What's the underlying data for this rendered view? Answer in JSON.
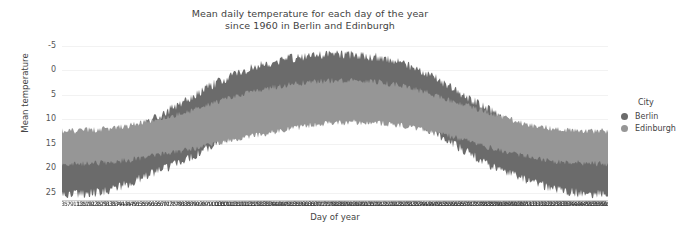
{
  "title": {
    "line1": "Mean daily temperature for each day of the year",
    "line2": "since 1960 in Berlin and Edinburgh"
  },
  "legend": {
    "title": "City",
    "items": [
      {
        "label": "Berlin",
        "color": "#6b6b6b"
      },
      {
        "label": "Edinburgh",
        "color": "#969696"
      }
    ]
  },
  "axes": {
    "ylabel": "Mean temperature",
    "xlabel": "Day of year",
    "yticks": [
      "25",
      "20",
      "15",
      "10",
      "5",
      "0",
      "-5"
    ]
  },
  "chart_data": {
    "type": "area",
    "title": "Mean daily temperature for each day of the year since 1960 in Berlin and Edinburgh",
    "xlabel": "Day of year",
    "ylabel": "Mean temperature",
    "xlim": [
      1,
      366
    ],
    "ylim": [
      -6.5,
      26
    ],
    "yticks": [
      -5,
      0,
      5,
      10,
      15,
      20,
      25
    ],
    "grid": true,
    "legend_position": "right",
    "legend_title": "City",
    "note": "Daily min-max envelope bands of mean temperature across years since 1960; x tick labels are day-of-year values drawn so densely that they overlap into an unreadable dark smear along the bottom axis.",
    "series": [
      {
        "name": "Berlin",
        "color": "#6b6b6b",
        "kind": "envelope",
        "x": [
          1,
          15,
          32,
          46,
          60,
          74,
          91,
          105,
          121,
          135,
          152,
          166,
          182,
          196,
          213,
          227,
          244,
          258,
          274,
          288,
          305,
          319,
          335,
          349,
          366
        ],
        "upper": [
          5.0,
          5.2,
          6.0,
          7.5,
          9.5,
          12.0,
          15.0,
          17.5,
          19.5,
          21.0,
          22.3,
          22.8,
          23.2,
          23.0,
          22.5,
          21.5,
          19.5,
          17.0,
          14.0,
          11.5,
          8.5,
          6.5,
          5.2,
          5.0,
          5.0
        ],
        "lower": [
          -5.0,
          -5.2,
          -4.5,
          -3.0,
          -1.0,
          0.5,
          3.0,
          5.5,
          7.5,
          9.0,
          10.5,
          11.5,
          12.0,
          12.0,
          11.5,
          10.5,
          8.5,
          6.0,
          3.0,
          0.5,
          -1.5,
          -3.0,
          -4.5,
          -5.0,
          -5.2
        ]
      },
      {
        "name": "Edinburgh",
        "color": "#969696",
        "kind": "envelope",
        "x": [
          1,
          15,
          32,
          46,
          60,
          74,
          91,
          105,
          121,
          135,
          152,
          166,
          182,
          196,
          213,
          227,
          244,
          258,
          274,
          288,
          305,
          319,
          335,
          349,
          366
        ],
        "upper": [
          7.5,
          7.6,
          8.0,
          8.6,
          9.5,
          10.5,
          12.0,
          13.5,
          15.0,
          16.0,
          17.0,
          17.5,
          17.8,
          17.8,
          17.5,
          16.8,
          15.5,
          14.0,
          12.5,
          11.0,
          9.5,
          8.4,
          7.8,
          7.6,
          7.5
        ],
        "lower": [
          1.0,
          1.0,
          1.3,
          1.8,
          2.5,
          3.2,
          4.2,
          5.2,
          6.2,
          7.0,
          8.0,
          8.8,
          9.3,
          9.5,
          9.3,
          8.8,
          7.8,
          6.8,
          5.5,
          4.2,
          3.0,
          2.0,
          1.4,
          1.1,
          1.0
        ]
      }
    ]
  }
}
